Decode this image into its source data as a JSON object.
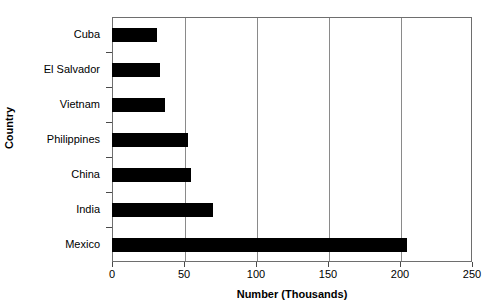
{
  "chart_data": {
    "type": "bar",
    "orientation": "horizontal",
    "title": "",
    "xlabel": "Number (Thousands)",
    "ylabel": "Country",
    "categories": [
      "Cuba",
      "El Salvador",
      "Vietnam",
      "Philippines",
      "China",
      "India",
      "Mexico"
    ],
    "values": [
      31,
      33,
      37,
      53,
      55,
      70,
      205
    ],
    "xlim": [
      0,
      250
    ],
    "xticks": [
      0,
      50,
      100,
      150,
      200,
      250
    ],
    "xtick_labels": [
      "0",
      "50",
      "100",
      "150",
      "200",
      "250"
    ],
    "gridlines": [
      50,
      100,
      150,
      200
    ],
    "grid": true,
    "legend": null,
    "bar_color": "#000000",
    "grid_color": "#8a8a8a",
    "frame_color": "#6e6e6e",
    "background_color": "#ffffff"
  }
}
